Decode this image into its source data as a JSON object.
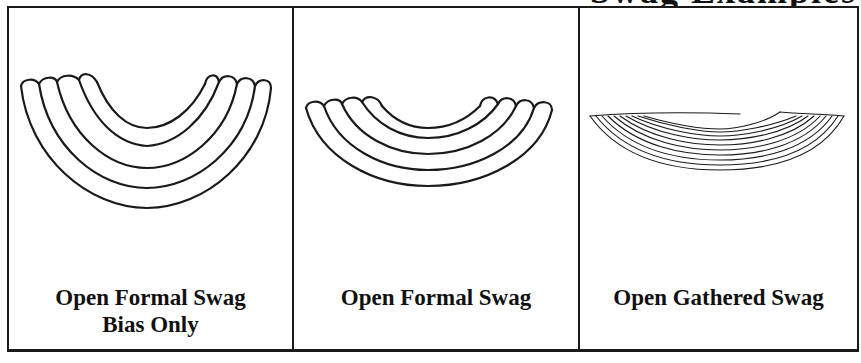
{
  "heading": {
    "text": "Swag Examples",
    "note": "cut off at top edge; only descenders visible"
  },
  "panels": [
    {
      "label_line1": "Open Formal Swag",
      "label_line2": "Bias Only",
      "illustration": "formal-swag-bias-icon",
      "layers": 4
    },
    {
      "label_line1": "Open Formal Swag",
      "label_line2": "",
      "illustration": "formal-swag-icon",
      "layers": 4
    },
    {
      "label_line1": "Open Gathered Swag",
      "label_line2": "",
      "illustration": "gathered-swag-icon",
      "layers": 10
    }
  ],
  "colors": {
    "line": "#1a1a1a",
    "background": "#ffffff"
  }
}
